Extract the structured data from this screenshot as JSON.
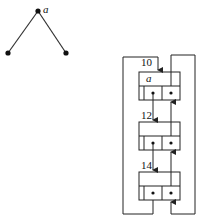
{
  "tree": {
    "root_label": "a",
    "nodes": [
      {
        "id": "root",
        "x": 38,
        "y": 11
      },
      {
        "id": "left-child",
        "x": 8,
        "y": 53
      },
      {
        "id": "right-child",
        "x": 66,
        "y": 53
      }
    ]
  },
  "list": {
    "nodes": [
      {
        "address": "10",
        "value": "a"
      },
      {
        "address": "12",
        "value": ""
      },
      {
        "address": "14",
        "value": ""
      }
    ]
  },
  "colors": {
    "stroke": "#222222",
    "background": "#ffffff"
  }
}
